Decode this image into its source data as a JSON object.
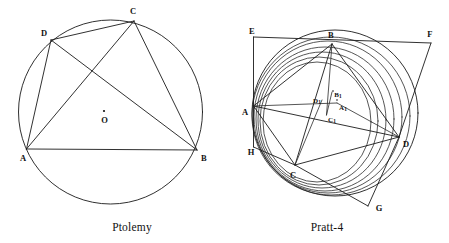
{
  "figure": {
    "background_color": "#ffffff",
    "ink_color": "#111111"
  },
  "panels": [
    {
      "id": "ptolemy",
      "caption": "Ptolemy",
      "caption_pos": {
        "x": 132,
        "y": 227
      },
      "circle": {
        "cx": 110.5,
        "cy": 112,
        "r": 92
      },
      "center_marker": {
        "x": 104,
        "y": 111,
        "label": "O",
        "label_x": 104.5,
        "label_y": 120
      },
      "vertices": [
        {
          "name": "A",
          "x": 26.5,
          "y": 149,
          "label": "A",
          "label_x": 23,
          "label_y": 158
        },
        {
          "name": "B",
          "x": 197,
          "y": 150,
          "label": "B",
          "label_x": 204,
          "label_y": 158
        },
        {
          "name": "C",
          "x": 134,
          "y": 21,
          "label": "C",
          "label_x": 133,
          "label_y": 11
        },
        {
          "name": "D",
          "x": 51,
          "y": 40,
          "label": "D",
          "label_x": 44,
          "label_y": 33
        }
      ],
      "segments": [
        [
          "A",
          "B"
        ],
        [
          "B",
          "C"
        ],
        [
          "C",
          "D"
        ],
        [
          "D",
          "A"
        ],
        [
          "A",
          "C"
        ],
        [
          "B",
          "D"
        ]
      ]
    },
    {
      "id": "pratt4",
      "caption": "Pratt-4",
      "caption_pos": {
        "x": 327,
        "y": 227
      },
      "main_circle": {
        "cx": 335,
        "cy": 113,
        "r": 83
      },
      "vertices": [
        {
          "name": "A",
          "x": 253.5,
          "y": 106,
          "label": "A",
          "label_x": 245,
          "label_y": 112
        },
        {
          "name": "B",
          "x": 332,
          "y": 44,
          "label": "B",
          "label_x": 331,
          "label_y": 35
        },
        {
          "name": "C",
          "x": 295,
          "y": 165,
          "label": "C",
          "label_x": 293,
          "label_y": 175
        },
        {
          "name": "D",
          "x": 399,
          "y": 137,
          "label": "D",
          "label_x": 406,
          "label_y": 144
        },
        {
          "name": "E",
          "x": 253.5,
          "y": 37,
          "label": "E",
          "label_x": 252,
          "label_y": 31
        },
        {
          "name": "F",
          "x": 431,
          "y": 43,
          "label": "F",
          "label_x": 430,
          "label_y": 34
        },
        {
          "name": "G",
          "x": 368,
          "y": 206,
          "label": "G",
          "label_x": 379,
          "label_y": 208
        },
        {
          "name": "H",
          "x": 253.5,
          "y": 147,
          "label": "H",
          "label_x": 251,
          "label_y": 152
        }
      ],
      "inner_points": [
        {
          "name": "A1",
          "label": "A",
          "sub": "1",
          "x": 337,
          "y": 103,
          "label_x": 343,
          "label_y": 108
        },
        {
          "name": "B1",
          "label": "B",
          "sub": "1",
          "x": 332,
          "y": 92,
          "label_x": 338,
          "label_y": 95
        },
        {
          "name": "C1",
          "label": "C",
          "sub": "1",
          "x": 326.5,
          "y": 115,
          "label_x": 332,
          "label_y": 120
        },
        {
          "name": "D1",
          "label": "D",
          "sub": "1",
          "x": 322,
          "y": 100,
          "label_x": 317,
          "label_y": 101
        }
      ],
      "segments": [
        [
          "A",
          "B"
        ],
        [
          "B",
          "D"
        ],
        [
          "D",
          "C"
        ],
        [
          "C",
          "A"
        ],
        [
          "A",
          "D"
        ],
        [
          "B",
          "C"
        ],
        [
          "E",
          "B"
        ],
        [
          "E",
          "H"
        ],
        [
          "E",
          "F"
        ],
        [
          "B",
          "F"
        ],
        [
          "F",
          "D"
        ],
        [
          "D",
          "G"
        ],
        [
          "G",
          "C"
        ],
        [
          "H",
          "C"
        ],
        [
          "H",
          "A"
        ],
        [
          "A",
          "A1"
        ],
        [
          "B",
          "C1"
        ],
        [
          "A1",
          "D"
        ],
        [
          "D1",
          "C"
        ]
      ],
      "arcs_count": 7
    }
  ]
}
